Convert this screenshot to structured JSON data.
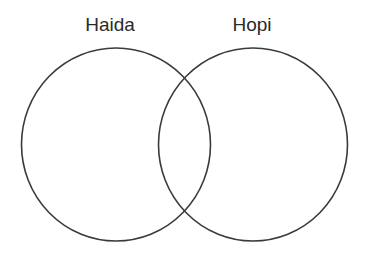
{
  "diagram": {
    "type": "venn",
    "sets": [
      {
        "label": "Haida"
      },
      {
        "label": "Hopi"
      }
    ],
    "colors": {
      "stroke": "#3a3a3a",
      "text": "#2a2a2a",
      "background": "#ffffff"
    }
  }
}
